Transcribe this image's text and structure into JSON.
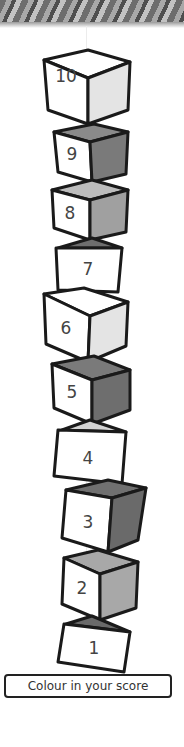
{
  "banner": {
    "pattern": "grey-textured-header"
  },
  "tower": {
    "cubes": [
      {
        "number": "10",
        "label_x": 46,
        "label_y": 78,
        "side_color": "#e4e4e4",
        "top_color": "#ffffff"
      },
      {
        "number": "9",
        "label_x": 54,
        "label_y": 147,
        "side_color": "#7a7a7a",
        "top_color": "#8a8a8a"
      },
      {
        "number": "8",
        "label_x": 54,
        "label_y": 200,
        "side_color": "#a0a0a0",
        "top_color": "#bdbdbd"
      },
      {
        "number": "7",
        "label_x": 75,
        "label_y": 256,
        "side_color": "#666666",
        "top_color": "#6e6e6e"
      },
      {
        "number": "6",
        "label_x": 52,
        "label_y": 318,
        "side_color": "#e4e4e4",
        "top_color": "#ffffff"
      },
      {
        "number": "5",
        "label_x": 56,
        "label_y": 380,
        "side_color": "#6e6e6e",
        "top_color": "#7a7a7a"
      },
      {
        "number": "4",
        "label_x": 72,
        "label_y": 450,
        "side_color": "#dcdcdc",
        "top_color": "#d4d4d4"
      },
      {
        "number": "3",
        "label_x": 74,
        "label_y": 511,
        "side_color": "#6a6a6a",
        "top_color": "#707070"
      },
      {
        "number": "2",
        "label_x": 66,
        "label_y": 578,
        "side_color": "#a8a8a8",
        "top_color": "#a8a8a8"
      },
      {
        "number": "1",
        "label_x": 80,
        "label_y": 640,
        "side_color": "#5e5e5e",
        "top_color": "#6a6a6a"
      }
    ]
  },
  "footer": {
    "instruction": "Colour in your score"
  }
}
